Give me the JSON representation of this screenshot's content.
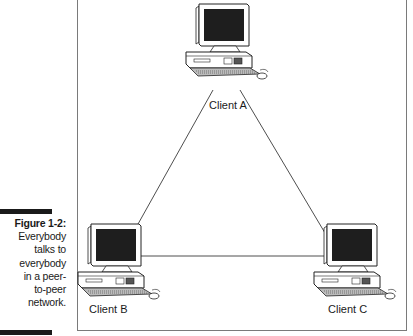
{
  "caption": {
    "figure_label": "Figure 1-2:",
    "lines": [
      "Everybody",
      "talks to",
      "everybody",
      "in a peer-",
      "to-peer",
      "network."
    ]
  },
  "nodes": [
    {
      "id": "client-a",
      "label": "Client A",
      "icon": "desktop-computer-icon"
    },
    {
      "id": "client-b",
      "label": "Client B",
      "icon": "desktop-computer-icon"
    },
    {
      "id": "client-c",
      "label": "Client C",
      "icon": "desktop-computer-icon"
    }
  ],
  "edges": [
    {
      "from": "Client A",
      "to": "Client B"
    },
    {
      "from": "Client A",
      "to": "Client C"
    },
    {
      "from": "Client B",
      "to": "Client C"
    }
  ],
  "colors": {
    "line": "#3a3a3a",
    "screen": "#1e1e1e",
    "frame": "#7a7a7a",
    "text": "#1a1a1a"
  }
}
